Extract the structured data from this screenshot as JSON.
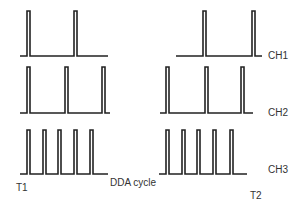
{
  "diagram": {
    "colors": {
      "line": "#222222",
      "text": "#333333",
      "background": "#ffffff"
    },
    "channels": [
      {
        "name": "CH1",
        "label_pos": [
          268,
          52
        ],
        "baseline_y": 56,
        "top_y": 11,
        "segments": [
          {
            "x0": 20,
            "x1": 108,
            "pulses": [
              27,
              74
            ]
          },
          {
            "x0": 176,
            "x1": 262,
            "pulses": [
              203,
              252
            ]
          }
        ]
      },
      {
        "name": "CH2",
        "label_pos": [
          268,
          108
        ],
        "baseline_y": 113,
        "top_y": 67,
        "segments": [
          {
            "x0": 20,
            "x1": 110,
            "pulses": [
              27,
              65,
              102
            ]
          },
          {
            "x0": 160,
            "x1": 253,
            "pulses": [
              166,
              205,
              241
            ]
          }
        ]
      },
      {
        "name": "CH3",
        "label_pos": [
          268,
          165
        ],
        "baseline_y": 174,
        "top_y": 130,
        "segments": [
          {
            "x0": 20,
            "x1": 108,
            "pulses": [
              27,
              43,
              58,
              74,
              90
            ]
          },
          {
            "x0": 159,
            "x1": 247,
            "pulses": [
              166,
              182,
              197,
              213,
              230
            ]
          }
        ]
      }
    ],
    "labels": {
      "t1": "T1",
      "t2": "T2",
      "dda_cycle": "DDA cycle",
      "ch1": "CH1",
      "ch2": "CH2",
      "ch3": "CH3"
    }
  }
}
